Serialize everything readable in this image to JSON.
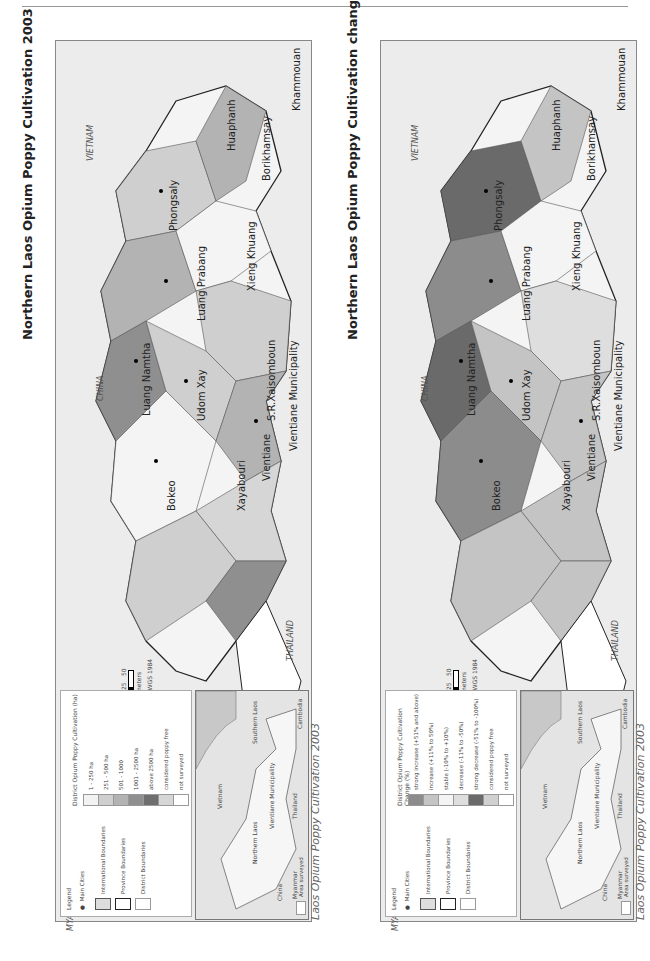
{
  "panels": [
    {
      "id": "cultivation-2003",
      "title": "Northern Laos Opium Poppy Cultivation 2003",
      "source_prefix": "Source: LCDC – UNODC ",
      "source_italic": "Laos Opium Poppy Cultivation 2003",
      "countries": [
        "CHINA",
        "MYANMAR",
        "VIETNAM",
        "THAILAND"
      ],
      "provinces": [
        "Phongsaly",
        "Luang Namtha",
        "Bokeo",
        "Udom Xay",
        "Luang Prabang",
        "Huaphanh",
        "Xieng Khuang",
        "Xayabouri",
        "Vientiane",
        "S.R.Xaisomboun",
        "Vientiane Municipality",
        "Borikhamsay",
        "Khammouan"
      ],
      "scale": {
        "ticks": [
          "0",
          "25",
          "50"
        ],
        "unit": "Kilometers",
        "projection": "Projection: WGS 1984",
        "north": "N"
      },
      "legend": {
        "title": "Legend",
        "symbols": [
          {
            "label": "Main Cities",
            "type": "dot"
          },
          {
            "label": "International Boundaries",
            "type": "intl"
          },
          {
            "label": "Province Boundaries",
            "type": "prov"
          },
          {
            "label": "District Boundaries",
            "type": "dist"
          }
        ],
        "class_title": "District Opium Poppy Cultivation (ha)",
        "classes": [
          {
            "label": "1 - 250 ha",
            "color": "#f2f2f2"
          },
          {
            "label": "251 - 500 ha",
            "color": "#cfcfcf"
          },
          {
            "label": "501 - 1000",
            "color": "#b3b3b3"
          },
          {
            "label": "1001 - 2500 ha",
            "color": "#8f8f8f"
          },
          {
            "label": "above 2500 ha",
            "color": "#6e6e6e"
          },
          {
            "label": "considered poppy free",
            "color": "#d6d6d6"
          },
          {
            "label": "not surveyed",
            "color": "#ffffff"
          }
        ]
      },
      "inset": {
        "labels": [
          "China",
          "Myanmar",
          "Vietnam",
          "Northern Laos",
          "Vientiane Municipality",
          "Thailand",
          "Southern Laos",
          "Cambodia"
        ],
        "legend_label": "Area surveyed"
      }
    },
    {
      "id": "change-2002-2003",
      "title": "Northern Laos Opium Poppy Cultivation change 2002 - 2003",
      "source_prefix": "Source: LCDC – UNODC ",
      "source_italic": "Laos Opium Poppy Cultivation 2003",
      "countries": [
        "CHINA",
        "MYANMAR",
        "VIETNAM",
        "THAILAND"
      ],
      "provinces": [
        "Phongsaly",
        "Luang Namtha",
        "Bokeo",
        "Udom Xay",
        "Luang Prabang",
        "Huaphanh",
        "Xieng Khuang",
        "Xayabouri",
        "Vientiane",
        "S.R.Xaisomboun",
        "Vientiane Municipality",
        "Borikhamsay",
        "Khammouan"
      ],
      "scale": {
        "ticks": [
          "0",
          "25",
          "50"
        ],
        "unit": "Kilometers",
        "projection": "Projection: WGS 1984",
        "north": "N"
      },
      "legend": {
        "title": "Legend",
        "symbols": [
          {
            "label": "Main Cities",
            "type": "dot"
          },
          {
            "label": "International Boundaries",
            "type": "intl"
          },
          {
            "label": "Province Boundaries",
            "type": "prov"
          },
          {
            "label": "District Boundaries",
            "type": "dist"
          }
        ],
        "class_title": "District Opium Poppy Cultivation Change (%)",
        "classes": [
          {
            "label": "strong increase (+51% and above)",
            "color": "#8c8c8c"
          },
          {
            "label": "increase (+11% to 50%)",
            "color": "#c4c4c4"
          },
          {
            "label": "stable (-10% to +10%)",
            "color": "#f4f4f4"
          },
          {
            "label": "decrease (-11% to -50%)",
            "color": "#dedede"
          },
          {
            "label": "strong decrease (-51% to -100%)",
            "color": "#6a6a6a"
          },
          {
            "label": "considered poppy free",
            "color": "#d0d0d0"
          },
          {
            "label": "not surveyed",
            "color": "#ffffff"
          }
        ]
      },
      "inset": {
        "labels": [
          "China",
          "Myanmar",
          "Vietnam",
          "Northern Laos",
          "Vientiane Municipality",
          "Thailand",
          "Southern Laos",
          "Cambodia"
        ],
        "legend_label": "Area surveyed"
      }
    }
  ]
}
